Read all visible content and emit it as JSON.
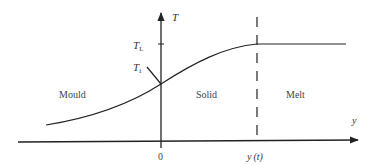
{
  "diagram": {
    "axes": {
      "vertical_label": "T",
      "horizontal_label": "y",
      "origin_label": "0",
      "interface_label_main": "y",
      "interface_label_arg": "(t)"
    },
    "temperature_levels": {
      "liquidus": {
        "symbol": "T",
        "subscript": "L"
      },
      "interface": {
        "symbol": "T",
        "subscript": "i"
      }
    },
    "regions": {
      "mould": "Mould",
      "solid": "Solid",
      "melt": "Melt"
    },
    "colors": {
      "line": "#222222",
      "text": "#333333",
      "background": "#ffffff"
    }
  }
}
